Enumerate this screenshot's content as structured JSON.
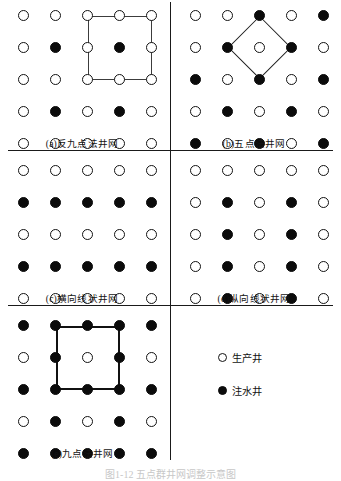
{
  "figure": {
    "title": "图1-12 五点群井网调整示意图",
    "well_symbols": {
      "producer": "producer-well-open-circle",
      "injector": "injector-well-filled-circle"
    },
    "colors": {
      "ink": "#111111",
      "producer_fill": "#ffffff",
      "injector_fill": "#0b0b0b",
      "rule": "#1a1a1a",
      "outline_thin": "#3c3c3c",
      "outline_thick": "#111111"
    }
  },
  "legend": {
    "items": [
      {
        "symbol": "producer",
        "label": "生产井"
      },
      {
        "symbol": "injector",
        "label": "注水井"
      }
    ]
  },
  "panels": [
    {
      "id": "a",
      "caption": "(a)反九点法井网",
      "pattern_name": "inverted-nine-spot",
      "rows": 5,
      "cols": 5,
      "grid": [
        [
          "producer",
          "producer",
          "producer",
          "producer",
          "producer"
        ],
        [
          "producer",
          "injector",
          "producer",
          "injector",
          "producer"
        ],
        [
          "producer",
          "producer",
          "producer",
          "producer",
          "producer"
        ],
        [
          "producer",
          "injector",
          "producer",
          "injector",
          "producer"
        ],
        [
          "producer",
          "producer",
          "producer",
          "producer",
          "producer"
        ]
      ],
      "outline": {
        "shape": "square",
        "weight": "thin",
        "col_start": 3,
        "col_end": 5,
        "row_start": 1,
        "row_end": 3
      }
    },
    {
      "id": "b",
      "caption": "(b)五点法井网",
      "pattern_name": "five-spot",
      "rows": 5,
      "cols": 5,
      "grid": [
        [
          "producer",
          "producer",
          "injector",
          "producer",
          "injector"
        ],
        [
          "producer",
          "injector",
          "producer",
          "injector",
          "producer"
        ],
        [
          "injector",
          "producer",
          "injector",
          "producer",
          "injector"
        ],
        [
          "producer",
          "injector",
          "producer",
          "injector",
          "producer"
        ],
        [
          "injector",
          "producer",
          "injector",
          "producer",
          "injector"
        ]
      ],
      "outline": {
        "shape": "diamond",
        "weight": "thin",
        "center_col": 3,
        "center_row": 2,
        "half_span": 1
      }
    },
    {
      "id": "c",
      "caption": "(c)横向线状井网",
      "pattern_name": "horizontal-line-drive",
      "rows": 5,
      "cols": 5,
      "grid": [
        [
          "producer",
          "producer",
          "producer",
          "producer",
          "producer"
        ],
        [
          "injector",
          "injector",
          "injector",
          "injector",
          "injector"
        ],
        [
          "producer",
          "producer",
          "producer",
          "producer",
          "producer"
        ],
        [
          "injector",
          "injector",
          "injector",
          "injector",
          "injector"
        ],
        [
          "producer",
          "producer",
          "producer",
          "producer",
          "producer"
        ]
      ],
      "outline": null
    },
    {
      "id": "d",
      "caption": "(d)纵向线状井网",
      "pattern_name": "vertical-line-drive",
      "rows": 5,
      "cols": 5,
      "grid": [
        [
          "producer",
          "producer",
          "producer",
          "producer",
          "producer"
        ],
        [
          "producer",
          "injector",
          "producer",
          "injector",
          "producer"
        ],
        [
          "producer",
          "injector",
          "producer",
          "injector",
          "producer"
        ],
        [
          "producer",
          "injector",
          "producer",
          "injector",
          "producer"
        ],
        [
          "producer",
          "injector",
          "producer",
          "injector",
          "producer"
        ]
      ],
      "outline": null
    },
    {
      "id": "e",
      "caption": "(e)九点法井网",
      "pattern_name": "nine-spot",
      "rows": 5,
      "cols": 5,
      "grid": [
        [
          "injector",
          "injector",
          "injector",
          "injector",
          "injector"
        ],
        [
          "producer",
          "injector",
          "producer",
          "injector",
          "producer"
        ],
        [
          "injector",
          "injector",
          "injector",
          "injector",
          "injector"
        ],
        [
          "producer",
          "injector",
          "producer",
          "injector",
          "producer"
        ],
        [
          "injector",
          "injector",
          "injector",
          "injector",
          "injector"
        ]
      ],
      "outline": {
        "shape": "square",
        "weight": "thick",
        "col_start": 2,
        "col_end": 4,
        "row_start": 1,
        "row_end": 3
      }
    }
  ],
  "layout": {
    "panel_boxes": {
      "a": {
        "left": 18,
        "top": 10,
        "cell": 32,
        "dot": 11
      },
      "b": {
        "left": 190,
        "top": 10,
        "cell": 32,
        "dot": 11
      },
      "c": {
        "left": 18,
        "top": 165,
        "cell": 32,
        "dot": 11
      },
      "d": {
        "left": 190,
        "top": 165,
        "cell": 32,
        "dot": 11
      },
      "e": {
        "left": 18,
        "top": 320,
        "cell": 32,
        "dot": 11
      }
    },
    "caption_positions": {
      "a": {
        "left": 18,
        "top": 136,
        "width": 128
      },
      "b": {
        "left": 190,
        "top": 136,
        "width": 128
      },
      "c": {
        "left": 18,
        "top": 291,
        "width": 128
      },
      "d": {
        "left": 190,
        "top": 291,
        "width": 128
      },
      "e": {
        "left": 18,
        "top": 446,
        "width": 128
      }
    },
    "rules": {
      "h1_top": 150,
      "h2_top": 305,
      "v_top_x": 170,
      "v_top_y0": 2,
      "v_top_y1": 150,
      "v_mid_x": 170,
      "v_mid_y0": 150,
      "v_mid_y1": 305,
      "v_bot_x": 170,
      "v_bot_y0": 305,
      "v_bot_y1": 460
    },
    "legend_position": {
      "left": 218,
      "top": 350
    },
    "legend_row_gap": 33
  }
}
